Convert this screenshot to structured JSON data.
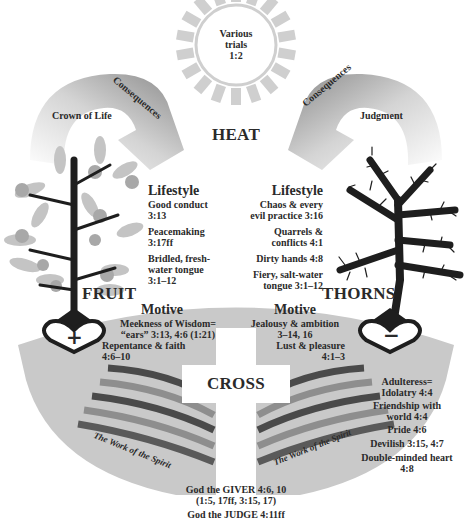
{
  "sun": {
    "text_lines": [
      "Various",
      "trials",
      "1:2"
    ],
    "label": "HEAT"
  },
  "left_arrow": {
    "band_label": "Consequences",
    "inner_label": "Crown of Life"
  },
  "right_arrow": {
    "band_label": "Consequences",
    "inner_label": "Judgment"
  },
  "left_tree": {
    "label": "FRUIT",
    "heart_symbol": "+"
  },
  "right_tree": {
    "label": "THORNS",
    "heart_symbol": "−"
  },
  "lifestyle_left": {
    "heading": "Lifestyle",
    "items": [
      [
        "Good conduct",
        "3:13"
      ],
      [
        "Peacemaking",
        "3:17ff"
      ],
      [
        "Bridled, fresh-",
        "water tongue",
        "3:1–12"
      ]
    ]
  },
  "lifestyle_right": {
    "heading": "Lifestyle",
    "items": [
      [
        "Chaos & every",
        "evil practice 3:16"
      ],
      [
        "Quarrels &",
        "conflicts 4:1"
      ],
      [
        "Dirty hands 4:8"
      ],
      [
        "Fiery, salt-water",
        "tongue 3:1–12"
      ]
    ]
  },
  "motive_left": {
    "heading": "Motive",
    "lines": [
      "Meekness of Wisdom=",
      "“ears” 3:13, 4:6 (1:21)",
      "Repentance & faith",
      "4:6–10"
    ]
  },
  "motive_right": {
    "heading": "Motive",
    "lines": [
      "Jealousy & ambition",
      "3–14, 16",
      "Lust & pleasure",
      "4:1–3"
    ]
  },
  "cross": {
    "label": "CROSS"
  },
  "spirit_left": {
    "label": "The Work of the Spirit"
  },
  "spirit_right": {
    "label": "The Work of the Spirit"
  },
  "right_list": {
    "items": [
      [
        "Adulteress=",
        "Idolatry 4:4"
      ],
      [
        "Friendship with",
        "world 4:4"
      ],
      [
        "Pride 4:6"
      ],
      [
        "Devilish 3:15, 4:7"
      ],
      [
        "Double-minded heart",
        "4:8"
      ]
    ]
  },
  "footer": {
    "lines": [
      "God the GIVER 4:6, 10",
      "(1:5, 17ff, 3:15, 17)",
      "God the JUDGE 4:11ff"
    ]
  },
  "colors": {
    "ground": "#c9c9c9",
    "arrow_dark": "#8a8a8a",
    "arrow_light": "#d8d8d8",
    "sun_ray": "#cfcfcf",
    "stripe_dark": "#4a4a4a",
    "stripe_mid": "#8e8e8e",
    "tree": "#1e1e1e",
    "fruit": "#a8a8a8",
    "leaf": "#c4c4c4"
  }
}
